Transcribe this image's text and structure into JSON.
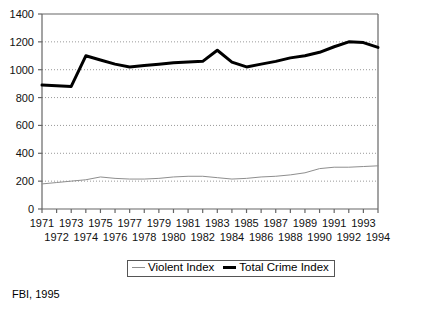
{
  "chart_data": {
    "type": "line",
    "title": "",
    "xlabel": "",
    "ylabel": "",
    "ylim": [
      0,
      1400
    ],
    "y_ticks": [
      0,
      200,
      400,
      600,
      800,
      1000,
      1200,
      1400
    ],
    "grid": "horizontal-dotted",
    "legend_position": "bottom-center",
    "x": [
      1971,
      1972,
      1973,
      1974,
      1975,
      1976,
      1977,
      1978,
      1979,
      1980,
      1981,
      1982,
      1983,
      1984,
      1985,
      1986,
      1987,
      1988,
      1989,
      1990,
      1991,
      1992,
      1993,
      1994
    ],
    "x_tick_labels_row1": [
      "1971",
      "",
      "1973",
      "",
      "1975",
      "",
      "1977",
      "",
      "1979",
      "",
      "1981",
      "",
      "1983",
      "",
      "1985",
      "",
      "1987",
      "",
      "1989",
      "",
      "1991",
      "",
      "1993",
      ""
    ],
    "x_tick_labels_row2": [
      "",
      "1972",
      "",
      "1974",
      "",
      "1976",
      "",
      "1978",
      "",
      "1980",
      "",
      "1982",
      "",
      "1984",
      "",
      "1986",
      "",
      "1988",
      "",
      "1990",
      "",
      "1992",
      "",
      "1994"
    ],
    "series": [
      {
        "name": "Violent Index",
        "color": "#8e8e8e",
        "width": 1,
        "values": [
          180,
          190,
          200,
          210,
          230,
          220,
          215,
          215,
          220,
          230,
          235,
          235,
          225,
          215,
          220,
          230,
          235,
          245,
          260,
          290,
          300,
          300,
          305,
          310
        ]
      },
      {
        "name": "Total Crime Index",
        "color": "#000000",
        "width": 3,
        "values": [
          890,
          885,
          880,
          1100,
          1070,
          1040,
          1020,
          1030,
          1040,
          1050,
          1055,
          1060,
          1140,
          1055,
          1020,
          1040,
          1060,
          1085,
          1100,
          1125,
          1165,
          1200,
          1195,
          1160
        ]
      }
    ]
  },
  "legend": {
    "entries": [
      {
        "label": "Violent Index",
        "style": "thin"
      },
      {
        "label": "Total Crime Index",
        "style": "thick"
      }
    ]
  },
  "source": {
    "note": "FBI, 1995"
  },
  "colors": {
    "violent_index": "#8e8e8e",
    "total_crime_index": "#000000",
    "axis": "#666666",
    "gridline": "#999999",
    "background": "#ffffff"
  }
}
